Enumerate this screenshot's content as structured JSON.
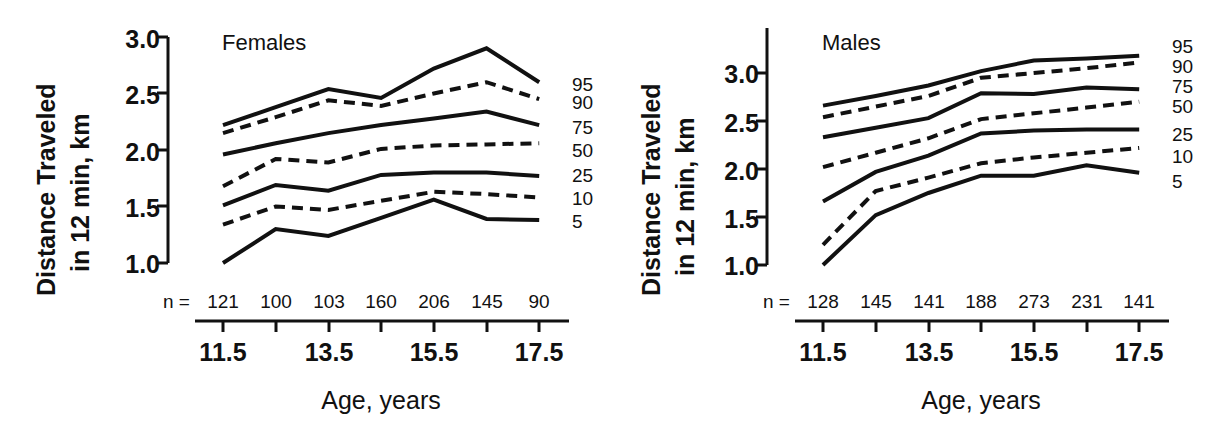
{
  "figure": {
    "background": "#ffffff",
    "ink_color": "#111111"
  },
  "panels": {
    "females": {
      "title": "Females",
      "ylabel_line1": "Distance Traveled",
      "ylabel_line2": "in 12 min, km",
      "xlabel": "Age,  years",
      "n_prefix": "n =",
      "y_ticks": [
        "1.0",
        "1.5",
        "2.0",
        "2.5",
        "3.0"
      ],
      "age_ticks": [
        "11.5",
        "13.5",
        "15.5",
        "17.5"
      ],
      "n_values": [
        "121",
        "100",
        "103",
        "160",
        "206",
        "145",
        "90"
      ],
      "pct_labels": [
        "95",
        "90",
        "75",
        "50",
        "25",
        "10",
        "5"
      ]
    },
    "males": {
      "title": "Males",
      "ylabel_line1": "Distance Traveled",
      "ylabel_line2": "in 12 min,  km",
      "xlabel": "Age,  years",
      "n_prefix": "n =",
      "y_ticks": [
        "1.0",
        "1.5",
        "2.0",
        "2.5",
        "3.0"
      ],
      "age_ticks": [
        "11.5",
        "13.5",
        "15.5",
        "17.5"
      ],
      "n_values": [
        "128",
        "145",
        "141",
        "188",
        "273",
        "231",
        "141"
      ],
      "pct_labels": [
        "95",
        "90",
        "75",
        "50",
        "25",
        "10",
        "5"
      ]
    }
  },
  "chart_data": [
    {
      "type": "line",
      "title": "Females",
      "xlabel": "Age, years",
      "ylabel": "Distance Traveled in 12 min, km",
      "x": [
        11.5,
        12.5,
        13.5,
        14.5,
        15.5,
        16.5,
        17.5
      ],
      "xlim": [
        11.0,
        18.0
      ],
      "ylim": [
        1.0,
        3.0
      ],
      "xtick_labels": [
        "11.5",
        "13.5",
        "15.5",
        "17.5"
      ],
      "ytick_labels": [
        "1.0",
        "1.5",
        "2.0",
        "2.5",
        "3.0"
      ],
      "grid": false,
      "legend_position": "right-of-axes (percentile labels at line ends)",
      "sample_sizes": [
        121,
        100,
        103,
        160,
        206,
        145,
        90
      ],
      "series": [
        {
          "name": "95",
          "style": "solid",
          "values": [
            2.22,
            2.38,
            2.54,
            2.46,
            2.72,
            2.9,
            2.6
          ]
        },
        {
          "name": "90",
          "style": "dashed",
          "values": [
            2.15,
            2.29,
            2.44,
            2.39,
            2.5,
            2.6,
            2.45
          ]
        },
        {
          "name": "75",
          "style": "solid",
          "values": [
            1.96,
            2.06,
            2.15,
            2.22,
            2.28,
            2.34,
            2.22
          ]
        },
        {
          "name": "50",
          "style": "dashed",
          "values": [
            1.68,
            1.92,
            1.89,
            2.01,
            2.04,
            2.05,
            2.06
          ]
        },
        {
          "name": "25",
          "style": "solid",
          "values": [
            1.51,
            1.69,
            1.64,
            1.78,
            1.8,
            1.8,
            1.77
          ]
        },
        {
          "name": "10",
          "style": "dashed",
          "values": [
            1.34,
            1.5,
            1.47,
            1.55,
            1.63,
            1.61,
            1.58
          ]
        },
        {
          "name": "5",
          "style": "solid",
          "values": [
            1.0,
            1.3,
            1.24,
            1.4,
            1.56,
            1.39,
            1.38
          ]
        }
      ]
    },
    {
      "type": "line",
      "title": "Males",
      "xlabel": "Age, years",
      "ylabel": "Distance Traveled in 12 min, km",
      "x": [
        11.5,
        12.5,
        13.5,
        14.5,
        15.5,
        16.5,
        17.5
      ],
      "xlim": [
        11.0,
        18.0
      ],
      "ylim": [
        1.0,
        3.3
      ],
      "xtick_labels": [
        "11.5",
        "13.5",
        "15.5",
        "17.5"
      ],
      "ytick_labels": [
        "1.0",
        "1.5",
        "2.0",
        "2.5",
        "3.0"
      ],
      "grid": false,
      "legend_position": "right-of-axes (percentile labels at line ends)",
      "sample_sizes": [
        128,
        145,
        141,
        188,
        273,
        231,
        141
      ],
      "series": [
        {
          "name": "95",
          "style": "solid",
          "values": [
            2.66,
            2.76,
            2.87,
            3.02,
            3.13,
            3.15,
            3.18
          ]
        },
        {
          "name": "90",
          "style": "dashed",
          "values": [
            2.54,
            2.65,
            2.76,
            2.95,
            3.0,
            3.05,
            3.11
          ]
        },
        {
          "name": "75",
          "style": "solid",
          "values": [
            2.33,
            2.43,
            2.53,
            2.79,
            2.78,
            2.85,
            2.83
          ]
        },
        {
          "name": "50",
          "style": "dashed",
          "values": [
            2.02,
            2.17,
            2.32,
            2.52,
            2.58,
            2.64,
            2.7
          ]
        },
        {
          "name": "25",
          "style": "solid",
          "values": [
            1.66,
            1.97,
            2.14,
            2.37,
            2.4,
            2.41,
            2.41
          ]
        },
        {
          "name": "10",
          "style": "dashed",
          "values": [
            1.21,
            1.77,
            1.91,
            2.06,
            2.12,
            2.17,
            2.22
          ]
        },
        {
          "name": "5",
          "style": "solid",
          "values": [
            1.0,
            1.52,
            1.75,
            1.93,
            1.93,
            2.04,
            1.96
          ]
        }
      ]
    }
  ]
}
